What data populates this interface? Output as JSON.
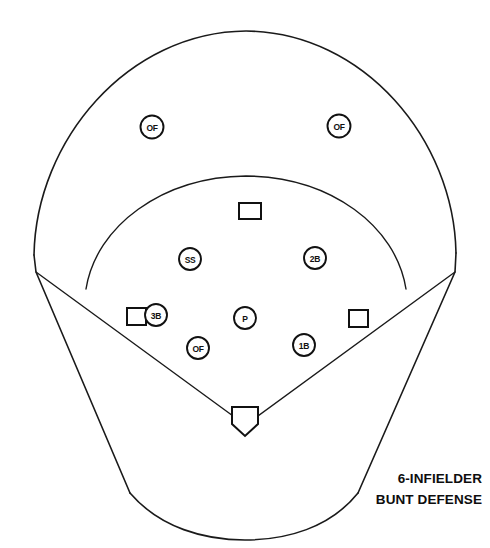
{
  "diagram": {
    "title_line_1": "6-INFIELDER",
    "title_line_2": "BUNT DEFENSE",
    "background_color": "#ffffff",
    "line_color": "#1a1a1a",
    "text_color": "#0d0d0d"
  },
  "players": [
    {
      "id": "of-left",
      "label": "OF",
      "x": 152,
      "y": 127,
      "name": "outfielder-left"
    },
    {
      "id": "of-right",
      "label": "OF",
      "x": 339,
      "y": 126,
      "name": "outfielder-right"
    },
    {
      "id": "ss",
      "label": "SS",
      "x": 190,
      "y": 259,
      "name": "shortstop"
    },
    {
      "id": "2b",
      "label": "2B",
      "x": 315,
      "y": 258,
      "name": "second-baseman"
    },
    {
      "id": "3b",
      "label": "3B",
      "x": 156,
      "y": 315,
      "name": "third-baseman"
    },
    {
      "id": "p",
      "label": "P",
      "x": 245,
      "y": 318,
      "name": "pitcher"
    },
    {
      "id": "of-in",
      "label": "OF",
      "x": 198,
      "y": 348,
      "name": "outfielder-infield"
    },
    {
      "id": "1b",
      "label": "1B",
      "x": 304,
      "y": 345,
      "name": "first-baseman"
    }
  ],
  "bases": [
    {
      "id": "second-base",
      "shape": "square",
      "x": 250,
      "y": 211,
      "name": "second-base"
    },
    {
      "id": "third-base",
      "shape": "square",
      "x": 137,
      "y": 317,
      "name": "third-base"
    },
    {
      "id": "first-base",
      "shape": "square",
      "x": 358,
      "y": 319,
      "name": "first-base"
    },
    {
      "id": "home-plate",
      "shape": "pentagon",
      "x": 245,
      "y": 417,
      "name": "home-plate"
    }
  ],
  "field_regions": [
    {
      "id": "outfield-wall",
      "name": "outfield-wall-arc"
    },
    {
      "id": "infield-arc",
      "name": "infield-dirt-arc"
    },
    {
      "id": "foul-line-left",
      "name": "foul-line-third-base"
    },
    {
      "id": "foul-line-right",
      "name": "foul-line-first-base"
    },
    {
      "id": "backstop",
      "name": "backstop-boundary"
    }
  ]
}
